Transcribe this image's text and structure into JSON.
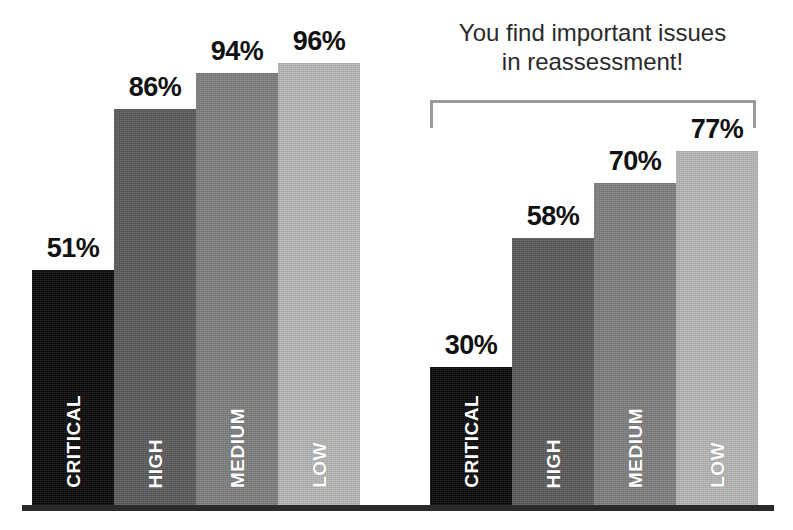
{
  "chart_data": {
    "type": "bar",
    "title": "",
    "xlabel": "",
    "ylabel": "",
    "ylim": [
      0,
      100
    ],
    "grid": false,
    "legend": "none",
    "value_suffix": "%",
    "categories": [
      "CRITICAL",
      "HIGH",
      "MEDIUM",
      "LOW"
    ],
    "series": [
      {
        "name": "Initial assessment",
        "values": [
          51,
          86,
          94,
          96
        ]
      },
      {
        "name": "Reassessment",
        "values": [
          30,
          58,
          70,
          77
        ]
      }
    ],
    "annotations": [
      {
        "text": "You find important issues in reassessment!",
        "target_series": "Reassessment"
      }
    ]
  },
  "groups": [
    {
      "id": "left",
      "bars": [
        {
          "category": "CRITICAL",
          "value_label": "51%",
          "value": 51,
          "color": "#0b0b0b",
          "severity": "critical"
        },
        {
          "category": "HIGH",
          "value_label": "86%",
          "value": 86,
          "color": "#5c5c5c",
          "severity": "high"
        },
        {
          "category": "MEDIUM",
          "value_label": "94%",
          "value": 94,
          "color": "#7f7f7f",
          "severity": "medium"
        },
        {
          "category": "LOW",
          "value_label": "96%",
          "value": 96,
          "color": "#b7b7b7",
          "severity": "low"
        }
      ]
    },
    {
      "id": "right",
      "bars": [
        {
          "category": "CRITICAL",
          "value_label": "30%",
          "value": 30,
          "color": "#0b0b0b",
          "severity": "critical"
        },
        {
          "category": "HIGH",
          "value_label": "58%",
          "value": 58,
          "color": "#5c5c5c",
          "severity": "high"
        },
        {
          "category": "MEDIUM",
          "value_label": "70%",
          "value": 70,
          "color": "#7f7f7f",
          "severity": "medium"
        },
        {
          "category": "LOW",
          "value_label": "77%",
          "value": 77,
          "color": "#b7b7b7",
          "severity": "low"
        }
      ]
    }
  ],
  "annotation": {
    "line1": "You find important issues",
    "line2": "in reassessment!",
    "bracket_color": "#9a9a9a"
  },
  "axis": {
    "baseline_color": "#2b2b2b"
  }
}
